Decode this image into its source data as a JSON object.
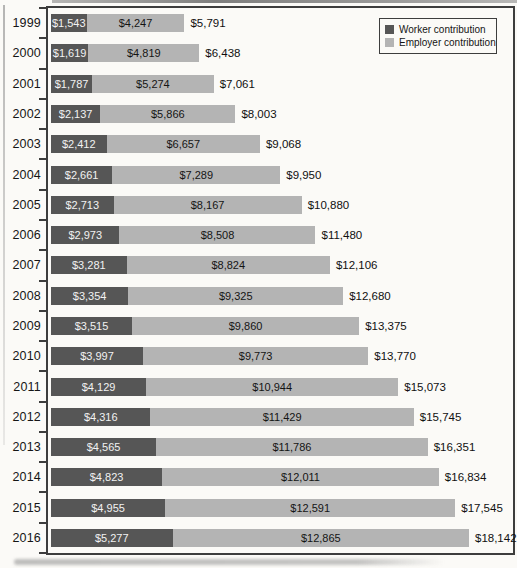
{
  "chart_data": {
    "type": "bar",
    "variant": "horizontal-stacked",
    "title": "",
    "xlabel": "",
    "ylabel": "",
    "xlim": [
      0,
      20000
    ],
    "grid": false,
    "value_axis_labels_visible": false,
    "legend_position": "top-right",
    "categories": [
      "1999",
      "2000",
      "2001",
      "2002",
      "2003",
      "2004",
      "2005",
      "2006",
      "2007",
      "2008",
      "2009",
      "2010",
      "2011",
      "2012",
      "2013",
      "2014",
      "2015",
      "2016"
    ],
    "series": [
      {
        "name": "Worker contribution",
        "color": "#565656",
        "values": [
          1543,
          1619,
          1787,
          2137,
          2412,
          2661,
          2713,
          2973,
          3281,
          3354,
          3515,
          3997,
          4129,
          4316,
          4565,
          4823,
          4955,
          5277
        ],
        "labels": [
          "$1,543",
          "$1,619",
          "$1,787",
          "$2,137",
          "$2,412",
          "$2,661",
          "$2,713",
          "$2,973",
          "$3,281",
          "$3,354",
          "$3,515",
          "$3,997",
          "$4,129",
          "$4,316",
          "$4,565",
          "$4,823",
          "$4,955",
          "$5,277"
        ]
      },
      {
        "name": "Employer contribution",
        "color": "#b4b4b4",
        "values": [
          4247,
          4819,
          5274,
          5866,
          6657,
          7289,
          8167,
          8508,
          8824,
          9325,
          9860,
          9773,
          10944,
          11429,
          11786,
          12011,
          12591,
          12865
        ],
        "labels": [
          "$4,247",
          "$4,819",
          "$5,274",
          "$5,866",
          "$6,657",
          "$7,289",
          "$8,167",
          "$8,508",
          "$8,824",
          "$9,325",
          "$9,860",
          "$9,773",
          "$10,944",
          "$11,429",
          "$11,786",
          "$12,011",
          "$12,591",
          "$12,865"
        ]
      }
    ],
    "totals": {
      "values": [
        5791,
        6438,
        7061,
        8003,
        9068,
        9950,
        10880,
        11480,
        12106,
        12680,
        13375,
        13770,
        15073,
        15745,
        16351,
        16834,
        17545,
        18142
      ],
      "labels": [
        "$5,791",
        "$6,438",
        "$7,061",
        "$8,003",
        "$9,068",
        "$9,950",
        "$10,880",
        "$11,480",
        "$12,106",
        "$12,680",
        "$13,375",
        "$13,770",
        "$15,073",
        "$15,745",
        "$16,351",
        "$16,834",
        "$17,545",
        "$18,142"
      ]
    }
  }
}
